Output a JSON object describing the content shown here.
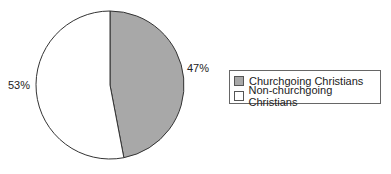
{
  "chart_data": {
    "type": "pie",
    "title": "",
    "labels": [
      "Churchgoing Christians",
      "Non-churchgoing Christians"
    ],
    "values": [
      47,
      53
    ],
    "value_labels": [
      "47%",
      "53%"
    ],
    "colors": [
      "#a8a8a8",
      "#ffffff"
    ],
    "legend_position": "right"
  },
  "legend": {
    "items": [
      {
        "label": "Churchgoing Christians",
        "color": "#a8a8a8"
      },
      {
        "label": "Non-churchgoing Christians",
        "color": "#ffffff"
      }
    ]
  },
  "labels": {
    "slice1": "47%",
    "slice2": "53%"
  }
}
